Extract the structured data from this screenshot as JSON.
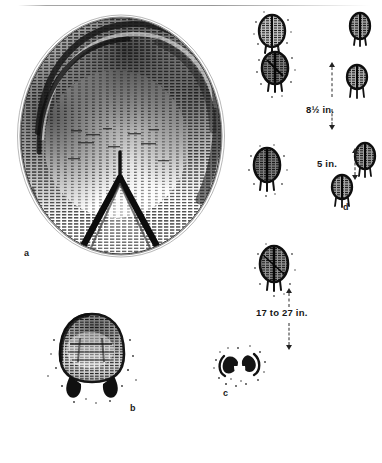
{
  "plate": {
    "kind": "engraved-illustration",
    "subject": "animal-tracks-plate",
    "background_color": "#ffffff",
    "ink_color": "#1a1a1a",
    "has_top_rule": true
  },
  "figures": [
    {
      "id": "a",
      "letter": "a",
      "description": "large oval hoof-print cast with horizontal line engraving",
      "letter_x": 24,
      "letter_y": 249
    },
    {
      "id": "b",
      "letter": "b",
      "description": "rounded track print with two toe pads below",
      "letter_x": 130,
      "letter_y": 404
    },
    {
      "id": "c",
      "letter": "c",
      "description": "small double-lobed cloven track in scattered debris",
      "letter_x": 223,
      "letter_y": 389
    },
    {
      "id": "d",
      "letter": "d",
      "description": "trail pattern of paired small tracks",
      "letter_x": 343,
      "letter_y": 203
    }
  ],
  "measurements": [
    {
      "id": "stride",
      "label": "8½ in.",
      "x": 306,
      "y": 105
    },
    {
      "id": "straddle",
      "label": "5 in.",
      "x": 317,
      "y": 159
    },
    {
      "id": "leap",
      "label": "17 to 27 in.",
      "x": 256,
      "y": 308
    }
  ],
  "caption": {
    "text": "",
    "visible": false
  }
}
